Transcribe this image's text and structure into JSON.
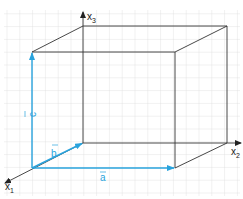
{
  "diagram": {
    "type": "3d-cuboid-vector-diagram",
    "background": "grid paper",
    "axes": {
      "x1": {
        "label": "x",
        "subscript": "1"
      },
      "x2": {
        "label": "x",
        "subscript": "2"
      },
      "x3": {
        "label": "x",
        "subscript": "3"
      }
    },
    "vectors": {
      "a": {
        "label": "a",
        "direction": "along x2"
      },
      "b": {
        "label": "b",
        "direction": "along -x1"
      },
      "c": {
        "label": "c",
        "direction": "along x3"
      }
    },
    "colors": {
      "vector": "#29a3dd",
      "edge": "#333333",
      "grid": "#dcdcdc",
      "background": "#ffffff"
    }
  }
}
